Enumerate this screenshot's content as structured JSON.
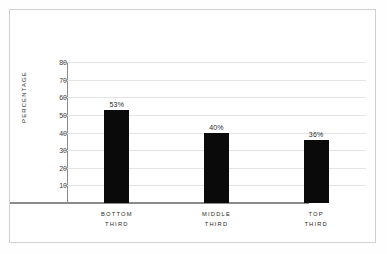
{
  "chart_data": {
    "type": "bar",
    "title": "",
    "xlabel": "",
    "ylabel": "PERCENTAGE",
    "categories": [
      "BOTTOM THIRD",
      "MIDDLE THIRD",
      "TOP THIRD"
    ],
    "category_lines": [
      [
        "BOTTOM",
        "THIRD"
      ],
      [
        "MIDDLE",
        "THIRD"
      ],
      [
        "TOP",
        "THIRD"
      ]
    ],
    "values": [
      53,
      40,
      36
    ],
    "value_labels": [
      "53%",
      "40%",
      "36%"
    ],
    "ylim": [
      0,
      80
    ],
    "yticks": [
      10,
      20,
      30,
      40,
      50,
      60,
      70,
      80
    ],
    "ytick_labels": [
      "10",
      "20",
      "30",
      "40",
      "50",
      "60",
      "70",
      "80"
    ],
    "grid": true,
    "legend": false,
    "bar_color": "#0a0a0a",
    "gridline_color": "#e4e4e4",
    "axis_color": "#8a8a8a",
    "background_color": "#ffffff",
    "border_color": "#cfcfcf"
  }
}
